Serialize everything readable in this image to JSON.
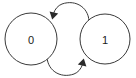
{
  "diagram": {
    "type": "state-transition-diagram",
    "background_color": "#ffffff",
    "stroke_color": "#3a3a3a",
    "label_color": "#1a1a1a",
    "arrow_color": "#2b2b2b",
    "states": [
      {
        "id": "state-0",
        "label": "0",
        "cx": 31,
        "cy": 39,
        "r": 26
      },
      {
        "id": "state-1",
        "label": "1",
        "cx": 105,
        "cy": 39,
        "r": 25
      }
    ],
    "transitions": [
      {
        "id": "transition-1-to-0",
        "from": "1",
        "to": "0",
        "label": "",
        "direction": "right-to-left",
        "position": "top",
        "path": "M 86 21 C 84 6, 68 0, 58 5",
        "arrow_at": {
          "x": 53,
          "y": 17
        }
      },
      {
        "id": "transition-0-to-1",
        "from": "0",
        "to": "1",
        "label": "",
        "direction": "left-to-right",
        "position": "bottom",
        "path": "M 50 57 C 52 72, 68 78, 80 73",
        "arrow_at": {
          "x": 84,
          "y": 60
        }
      }
    ]
  }
}
